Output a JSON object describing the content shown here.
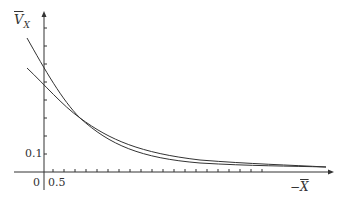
{
  "chart_data": {
    "type": "line",
    "title": "",
    "xlabel": "−X̄",
    "ylabel": "V̄_X",
    "x_tick_labels": [
      "0",
      "0.5"
    ],
    "y_tick_labels": [
      "0.1"
    ],
    "series": [
      {
        "name": "curve-steep",
        "x": [
          -1.0,
          0.5,
          1.5,
          2.5,
          4.0,
          6.0,
          9.0,
          13.0,
          17.0,
          20.5
        ],
        "values": [
          0.82,
          0.58,
          0.44,
          0.33,
          0.23,
          0.16,
          0.11,
          0.085,
          0.075,
          0.07
        ]
      },
      {
        "name": "curve-shallow",
        "x": [
          -1.0,
          0.5,
          1.5,
          2.5,
          4.0,
          6.0,
          9.0,
          13.0,
          17.0,
          20.5
        ],
        "values": [
          0.6,
          0.5,
          0.42,
          0.33,
          0.25,
          0.18,
          0.125,
          0.09,
          0.077,
          0.071
        ]
      }
    ],
    "grid": false,
    "legend": "none"
  },
  "labels": {
    "y_axis_symbol": "V",
    "y_axis_sub": "X",
    "x_axis_minus": "−",
    "x_axis_symbol": "X",
    "origin": "0",
    "x_tick": "0.5",
    "y_tick": "0.1"
  }
}
